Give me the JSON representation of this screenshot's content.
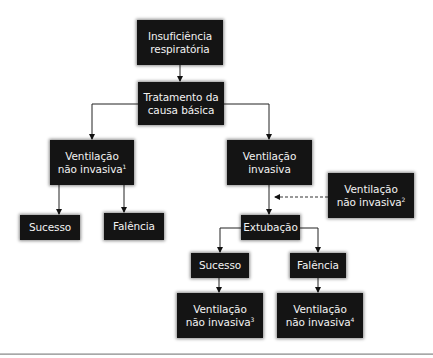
{
  "diagram": {
    "type": "flowchart",
    "nodes": {
      "insuficiencia": {
        "line1": "Insuficiência",
        "line2": "respiratória"
      },
      "tratamento": {
        "line1": "Tratamento da",
        "line2": "causa básica"
      },
      "vni1": {
        "line1": "Ventilação",
        "line2": "não invasiva",
        "sup": "1"
      },
      "sucesso1": {
        "label": "Sucesso"
      },
      "falencia1": {
        "label": "Falência"
      },
      "vi": {
        "line1": "Ventilação",
        "line2": "invasiva"
      },
      "vni2": {
        "line1": "Ventilação",
        "line2": "não invasiva",
        "sup": "2"
      },
      "extubacao": {
        "label": "Extubação"
      },
      "sucesso2": {
        "label": "Sucesso"
      },
      "falencia2": {
        "label": "Falência"
      },
      "vni3": {
        "line1": "Ventilação",
        "line2": "não invasiva",
        "sup": "3"
      },
      "vni4": {
        "line1": "Ventilação",
        "line2": "não invasiva",
        "sup": "4"
      }
    },
    "edges": [
      {
        "from": "insuficiencia",
        "to": "tratamento",
        "style": "solid"
      },
      {
        "from": "tratamento",
        "to": "vni1",
        "style": "solid"
      },
      {
        "from": "tratamento",
        "to": "vi",
        "style": "solid"
      },
      {
        "from": "vni1",
        "to": "sucesso1",
        "style": "solid"
      },
      {
        "from": "vni1",
        "to": "falencia1",
        "style": "solid"
      },
      {
        "from": "vi",
        "to": "extubacao",
        "style": "solid"
      },
      {
        "from": "vni2",
        "to": "vi-extubacao-link",
        "style": "dashed"
      },
      {
        "from": "extubacao",
        "to": "sucesso2",
        "style": "solid"
      },
      {
        "from": "extubacao",
        "to": "falencia2",
        "style": "solid"
      },
      {
        "from": "sucesso2",
        "to": "vni3",
        "style": "solid"
      },
      {
        "from": "falencia2",
        "to": "vni4",
        "style": "solid"
      }
    ],
    "colors": {
      "box": "#141414",
      "text": "#f2f2f2",
      "line": "#222222",
      "rule": "#a0a0a0"
    }
  }
}
